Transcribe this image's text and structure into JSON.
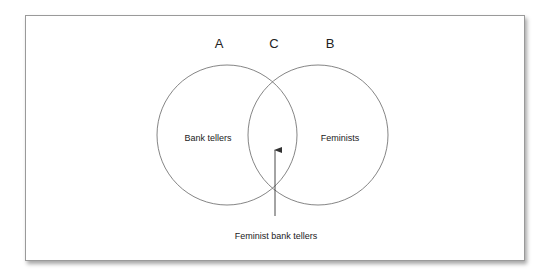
{
  "diagram": {
    "type": "venn",
    "set_letters": {
      "left": "A",
      "middle": "C",
      "right": "B"
    },
    "sets": [
      {
        "id": "A",
        "label": "Bank tellers"
      },
      {
        "id": "B",
        "label": "Feminists"
      }
    ],
    "intersection": {
      "id": "C",
      "label": "Feminist bank tellers"
    },
    "colors": {
      "stroke": "#666666",
      "text": "#222222",
      "frame": "#9a9a9a"
    }
  }
}
